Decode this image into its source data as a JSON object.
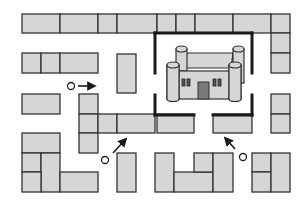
{
  "diagram": {
    "type": "maze-map",
    "colors": {
      "block_fill": "#d6d6d6",
      "block_stroke": "#333333",
      "wall": "#1a1a1a",
      "door": "#7a7a7a",
      "background": "#ffffff"
    },
    "blocks": [
      {
        "x": 22,
        "y": 14,
        "w": 38,
        "h": 19
      },
      {
        "x": 60,
        "y": 14,
        "w": 38,
        "h": 19
      },
      {
        "x": 98,
        "y": 14,
        "w": 19,
        "h": 19
      },
      {
        "x": 117,
        "y": 14,
        "w": 40,
        "h": 19
      },
      {
        "x": 157,
        "y": 14,
        "w": 19,
        "h": 19
      },
      {
        "x": 176,
        "y": 14,
        "w": 19,
        "h": 19
      },
      {
        "x": 195,
        "y": 14,
        "w": 38,
        "h": 19
      },
      {
        "x": 233,
        "y": 14,
        "w": 38,
        "h": 19
      },
      {
        "x": 271,
        "y": 14,
        "w": 19,
        "h": 19
      },
      {
        "x": 271,
        "y": 33,
        "w": 19,
        "h": 20
      },
      {
        "x": 271,
        "y": 53,
        "w": 19,
        "h": 20
      },
      {
        "x": 22,
        "y": 53,
        "w": 19,
        "h": 20
      },
      {
        "x": 41,
        "y": 53,
        "w": 19,
        "h": 20
      },
      {
        "x": 60,
        "y": 53,
        "w": 38,
        "h": 20
      },
      {
        "x": 117,
        "y": 54,
        "w": 19,
        "h": 39
      },
      {
        "x": 22,
        "y": 94,
        "w": 38,
        "h": 20
      },
      {
        "x": 79,
        "y": 94,
        "w": 19,
        "h": 20
      },
      {
        "x": 79,
        "y": 114,
        "w": 19,
        "h": 19
      },
      {
        "x": 79,
        "y": 133,
        "w": 19,
        "h": 20
      },
      {
        "x": 98,
        "y": 114,
        "w": 19,
        "h": 19
      },
      {
        "x": 117,
        "y": 114,
        "w": 38,
        "h": 19
      },
      {
        "x": 157,
        "y": 114,
        "w": 37,
        "h": 19
      },
      {
        "x": 213,
        "y": 114,
        "w": 39,
        "h": 19
      },
      {
        "x": 271,
        "y": 94,
        "w": 19,
        "h": 20
      },
      {
        "x": 271,
        "y": 114,
        "w": 19,
        "h": 19
      },
      {
        "x": 22,
        "y": 133,
        "w": 38,
        "h": 20
      },
      {
        "x": 22,
        "y": 153,
        "w": 19,
        "h": 19
      },
      {
        "x": 41,
        "y": 153,
        "w": 19,
        "h": 39
      },
      {
        "x": 22,
        "y": 172,
        "w": 19,
        "h": 20
      },
      {
        "x": 60,
        "y": 172,
        "w": 38,
        "h": 20
      },
      {
        "x": 117,
        "y": 153,
        "w": 19,
        "h": 39
      },
      {
        "x": 155,
        "y": 153,
        "w": 19,
        "h": 39
      },
      {
        "x": 174,
        "y": 172,
        "w": 39,
        "h": 20
      },
      {
        "x": 194,
        "y": 153,
        "w": 19,
        "h": 19
      },
      {
        "x": 213,
        "y": 153,
        "w": 20,
        "h": 39
      },
      {
        "x": 252,
        "y": 153,
        "w": 19,
        "h": 19
      },
      {
        "x": 252,
        "y": 172,
        "w": 19,
        "h": 20
      },
      {
        "x": 271,
        "y": 153,
        "w": 19,
        "h": 39
      }
    ],
    "walls": [
      {
        "x1": 155,
        "y1": 33,
        "x2": 252,
        "y2": 33
      },
      {
        "x1": 155,
        "y1": 33,
        "x2": 155,
        "y2": 73
      },
      {
        "x1": 252,
        "y1": 33,
        "x2": 252,
        "y2": 73
      },
      {
        "x1": 155,
        "y1": 95,
        "x2": 155,
        "y2": 115
      },
      {
        "x1": 252,
        "y1": 95,
        "x2": 252,
        "y2": 115
      },
      {
        "x1": 155,
        "y1": 115,
        "x2": 194,
        "y2": 115
      },
      {
        "x1": 213,
        "y1": 115,
        "x2": 252,
        "y2": 115
      }
    ],
    "start_points": [
      {
        "id": "start-a",
        "cx": 71,
        "cy": 86,
        "arrow": "right"
      },
      {
        "id": "start-b",
        "cx": 105,
        "cy": 160,
        "arrow": "up-right"
      },
      {
        "id": "start-c",
        "cx": 243,
        "cy": 157,
        "arrow": "up-left"
      }
    ],
    "landmark": {
      "name": "castle",
      "x": 168,
      "y": 44,
      "w": 78,
      "h": 58
    }
  }
}
